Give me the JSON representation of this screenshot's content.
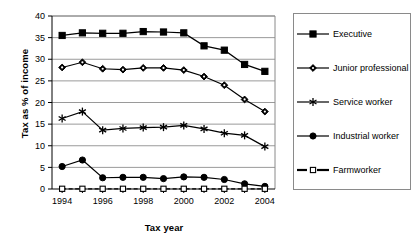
{
  "chart_data": {
    "type": "line",
    "title": "",
    "xlabel": "Tax year",
    "ylabel": "Tax as % of income",
    "x": [
      1994,
      1995,
      1996,
      1997,
      1998,
      1999,
      2000,
      2001,
      2002,
      2003,
      2004
    ],
    "xtick_labels": [
      "1994",
      "1996",
      "1998",
      "2000",
      "2002",
      "2004"
    ],
    "xtick_values": [
      1994,
      1996,
      1998,
      2000,
      2002,
      2004
    ],
    "ytick_labels": [
      "0",
      "5",
      "10",
      "15",
      "20",
      "25",
      "30",
      "35",
      "40"
    ],
    "ytick_values": [
      0,
      5,
      10,
      15,
      20,
      25,
      30,
      35,
      40
    ],
    "xlim": [
      1993.5,
      2004.5
    ],
    "ylim": [
      0,
      40
    ],
    "grid": "horizontal",
    "legend_position": "right",
    "series": [
      {
        "name": "Executive",
        "marker": "filled-square",
        "line": "solid",
        "color": "#000000",
        "values": [
          35.5,
          36.1,
          36.0,
          36.0,
          36.4,
          36.3,
          36.1,
          33.1,
          32.1,
          28.8,
          27.2
        ]
      },
      {
        "name": "Junior professional",
        "marker": "filled-diamond",
        "line": "solid",
        "color": "#000000",
        "values": [
          28.1,
          29.3,
          27.8,
          27.6,
          28.0,
          28.0,
          27.5,
          26.0,
          24.0,
          20.7,
          17.9
        ]
      },
      {
        "name": "Service worker",
        "marker": "asterisk",
        "line": "solid",
        "color": "#000000",
        "values": [
          16.3,
          17.9,
          13.6,
          14.0,
          14.2,
          14.3,
          14.7,
          13.9,
          12.9,
          12.4,
          9.8
        ]
      },
      {
        "name": "Industrial worker",
        "marker": "filled-circle",
        "line": "solid",
        "color": "#000000",
        "values": [
          5.2,
          6.7,
          2.6,
          2.7,
          2.7,
          2.4,
          2.8,
          2.7,
          2.2,
          1.2,
          0.6
        ]
      },
      {
        "name": "Farmworker",
        "marker": "open-square",
        "line": "dashed",
        "color": "#000000",
        "values": [
          0.05,
          0.05,
          0.05,
          0.05,
          0.05,
          0.05,
          0.05,
          0.05,
          0.05,
          0.05,
          0.05
        ]
      }
    ]
  },
  "legend": {
    "items": [
      {
        "label": "Executive"
      },
      {
        "label": "Junior professional"
      },
      {
        "label": "Service worker"
      },
      {
        "label": "Industrial worker"
      },
      {
        "label": "Farmworker"
      }
    ]
  }
}
